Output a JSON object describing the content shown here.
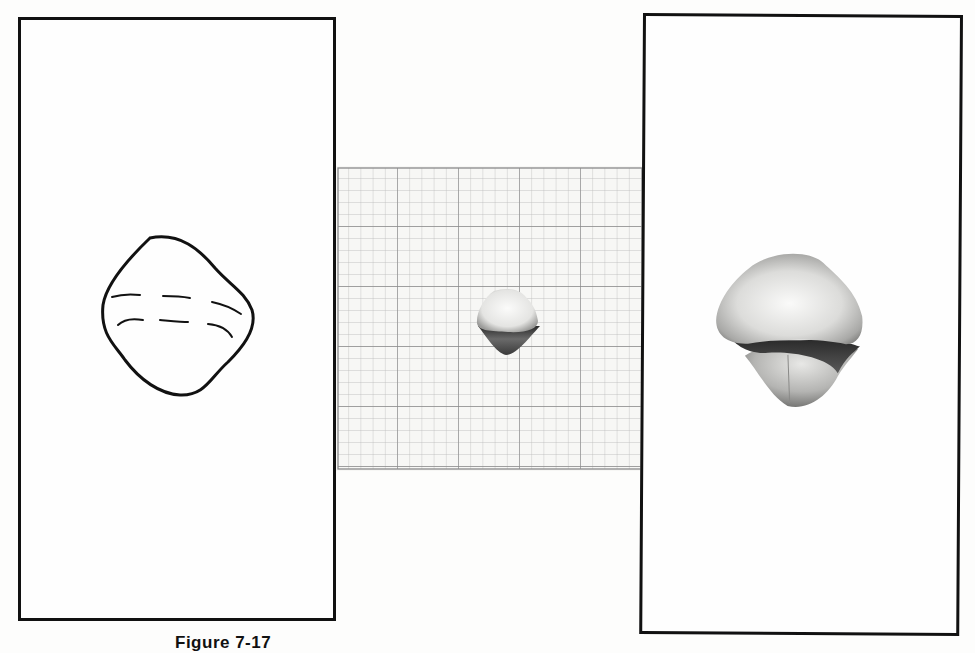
{
  "figure": {
    "caption": "Figure 7-17",
    "panels": [
      {
        "id": "left",
        "description": "Line drawing outline of rounded diamond-shaped object with two dashed contour lines"
      },
      {
        "id": "center",
        "description": "Small photograph of object on graph paper grid (5x5 major squares, 5 minor subdivisions each)"
      },
      {
        "id": "right",
        "description": "Enlarged shaded rendering of the object"
      }
    ],
    "grid": {
      "major_columns": 5,
      "major_rows": 5,
      "minor_per_major": 5
    },
    "colors": {
      "line": "#111111",
      "grid_major": "#8a8a8a",
      "grid_minor": "#b8b8b8",
      "paper": "#fefefe"
    }
  }
}
